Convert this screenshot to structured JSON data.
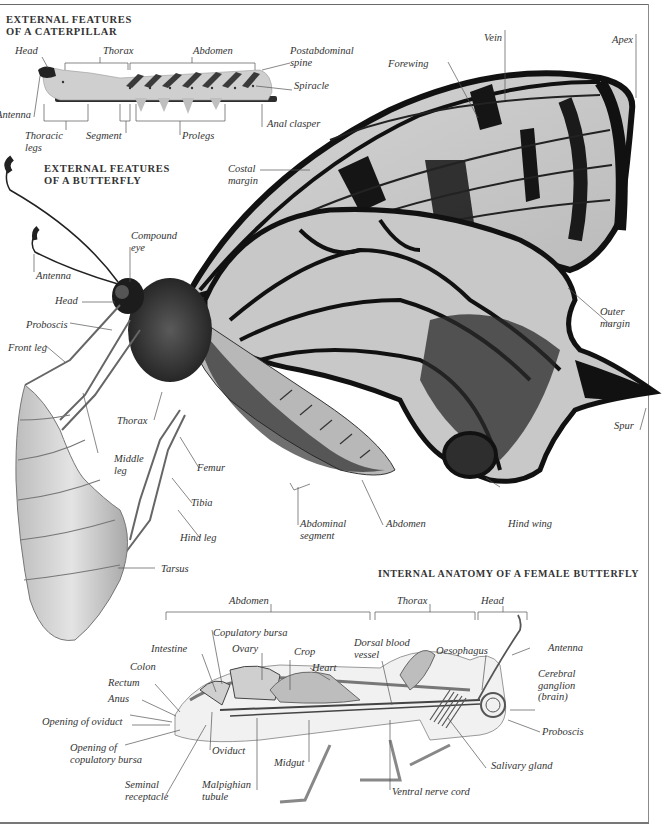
{
  "page": {
    "running_head": "ANIMALS",
    "frame_color": "#6a6a6a"
  },
  "caterpillar": {
    "heading_line1": "EXTERNAL FEATURES",
    "heading_line2": "OF A CATERPILLAR",
    "labels": {
      "head": "Head",
      "thorax": "Thorax",
      "abdomen": "Abdomen",
      "postabdominal_spine_1": "Postabdominal",
      "postabdominal_spine_2": "spine",
      "spiracle": "Spiracle",
      "antenna": "Antenna",
      "anal_clasper": "Anal clasper",
      "thoracic_legs_1": "Thoracic",
      "thoracic_legs_2": "legs",
      "segment": "Segment",
      "prolegs": "Prolegs"
    }
  },
  "butterfly": {
    "heading_line1": "EXTERNAL FEATURES",
    "heading_line2": "OF A BUTTERFLY",
    "labels": {
      "vein": "Vein",
      "apex": "Apex",
      "forewing": "Forewing",
      "costal_margin_1": "Costal",
      "costal_margin_2": "margin",
      "compound_eye_1": "Compound",
      "compound_eye_2": "eye",
      "antenna": "Antenna",
      "head": "Head",
      "proboscis": "Proboscis",
      "front_leg": "Front leg",
      "thorax": "Thorax",
      "middle_leg_1": "Middle",
      "middle_leg_2": "leg",
      "femur": "Femur",
      "tibia": "Tibia",
      "hind_leg": "Hind leg",
      "tarsus": "Tarsus",
      "abdominal_segment_1": "Abdominal",
      "abdominal_segment_2": "segment",
      "abdomen": "Abdomen",
      "hind_wing": "Hind wing",
      "outer_margin_1": "Outer",
      "outer_margin_2": "margin",
      "spur": "Spur"
    }
  },
  "internal": {
    "heading": "INTERNAL ANATOMY OF A FEMALE BUTTERFLY",
    "regions": {
      "abdomen": "Abdomen",
      "thorax": "Thorax",
      "head": "Head"
    },
    "labels": {
      "copulatory_bursa": "Copulatory bursa",
      "intestine": "Intestine",
      "ovary": "Ovary",
      "crop": "Crop",
      "heart": "Heart",
      "dorsal_blood_vessel_1": "Dorsal blood",
      "dorsal_blood_vessel_2": "vessel",
      "oesophagus": "Oesophagus",
      "antenna": "Antenna",
      "colon": "Colon",
      "rectum": "Rectum",
      "anus": "Anus",
      "cerebral_ganglion_1": "Cerebral",
      "cerebral_ganglion_2": "ganglion",
      "cerebral_ganglion_3": "(brain)",
      "opening_of_oviduct": "Opening of  oviduct",
      "proboscis": "Proboscis",
      "opening_of_bursa_1": "Opening of",
      "opening_of_bursa_2": "copulatory bursa",
      "oviduct": "Oviduct",
      "midgut": "Midgut",
      "salivary_gland": "Salivary gland",
      "seminal_receptacle_1": "Seminal",
      "seminal_receptacle_2": "receptacle",
      "malpighian_tubule_1": "Malpighian",
      "malpighian_tubule_2": "tubule",
      "ventral_nerve_cord": "Ventral nerve cord"
    }
  }
}
